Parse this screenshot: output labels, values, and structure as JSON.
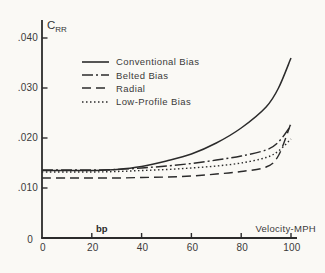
{
  "figure": {
    "background": "#faf9f5",
    "line_color": "#2b2b2b",
    "text_color": "#3a3a3a",
    "y_axis_symbol": "C",
    "y_axis_symbol_sub": "RR",
    "x_axis_label": "Velocity-MPH",
    "annotation_bp": "bp"
  },
  "legend": {
    "items": [
      {
        "label": "Conventional Bias",
        "style": "solid"
      },
      {
        "label": "Belted Bias",
        "style": "dashdot"
      },
      {
        "label": "Radial",
        "style": "dashed"
      },
      {
        "label": "Low-Profile Bias",
        "style": "dotted"
      }
    ]
  },
  "chart_data": {
    "type": "line",
    "title": "",
    "xlabel": "Velocity-MPH",
    "ylabel": "CRR",
    "xlim": [
      0,
      100
    ],
    "ylim": [
      0,
      0.0435
    ],
    "grid": false,
    "legend_position": "upper-left-inside",
    "x_ticks": [
      0,
      20,
      40,
      60,
      80,
      100
    ],
    "x_tick_labels": [
      "0",
      "20",
      "40",
      "60",
      "80",
      "100"
    ],
    "y_ticks": [
      0,
      0.01,
      0.02,
      0.03,
      0.04
    ],
    "y_tick_labels": [
      "0",
      ".010",
      ".020",
      ".030",
      ".040"
    ],
    "x": [
      0,
      10,
      20,
      30,
      40,
      50,
      60,
      70,
      80,
      90,
      95,
      100
    ],
    "series": [
      {
        "name": "Conventional Bias",
        "style": "solid",
        "values": [
          0.0135,
          0.0135,
          0.0135,
          0.0137,
          0.0143,
          0.0154,
          0.0168,
          0.019,
          0.022,
          0.0262,
          0.03,
          0.036
        ]
      },
      {
        "name": "Belted Bias",
        "style": "dashdot",
        "values": [
          0.0136,
          0.0136,
          0.0136,
          0.0137,
          0.014,
          0.0144,
          0.0149,
          0.0156,
          0.0164,
          0.0176,
          0.0192,
          0.0225
        ]
      },
      {
        "name": "Radial",
        "style": "dashed",
        "values": [
          0.012,
          0.012,
          0.012,
          0.012,
          0.0121,
          0.0122,
          0.0124,
          0.0128,
          0.0133,
          0.0142,
          0.0165,
          0.023
        ]
      },
      {
        "name": "Low-Profile Bias",
        "style": "dotted",
        "values": [
          0.0132,
          0.0132,
          0.0132,
          0.0133,
          0.0135,
          0.0137,
          0.014,
          0.0144,
          0.015,
          0.0161,
          0.0174,
          0.0198
        ]
      }
    ]
  }
}
